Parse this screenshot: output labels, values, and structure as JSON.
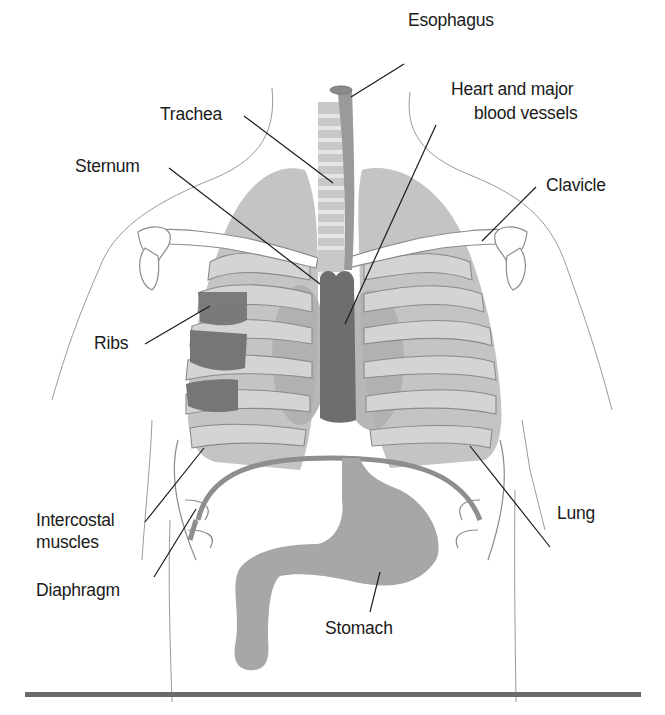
{
  "figure": {
    "colors": {
      "background": "#ffffff",
      "lung": "#c4c4c4",
      "rib_fill": "#d2d2d2",
      "outline": "#8a8a8a",
      "heart_shadow": "#a9a9a9",
      "heart": "#6e6e6e",
      "esophagus": "#9a9a9a",
      "trachea_ring": "#d0d0d0",
      "stomach": "#a8a8a8",
      "intercostal": "#767676",
      "diaphragm": "#8e8e8e",
      "leader_line": "#1a1a1a",
      "rule": "#6a6a6a"
    }
  },
  "labels": {
    "esophagus": "Esophagus",
    "trachea": "Trachea",
    "heart_line1": "Heart and major",
    "heart_line2": "blood vessels",
    "sternum": "Sternum",
    "clavicle": "Clavicle",
    "ribs": "Ribs",
    "intercostal_line1": "Intercostal",
    "intercostal_line2": "muscles",
    "lung": "Lung",
    "diaphragm": "Diaphragm",
    "stomach": "Stomach"
  },
  "leaders": [
    {
      "name": "esophagus",
      "x1": 404,
      "y1": 64,
      "x2": 351,
      "y2": 97
    },
    {
      "name": "trachea",
      "x1": 244,
      "y1": 116,
      "x2": 333,
      "y2": 183
    },
    {
      "name": "sternum",
      "x1": 169,
      "y1": 168,
      "x2": 320,
      "y2": 284
    },
    {
      "name": "heart",
      "x1": 436,
      "y1": 125,
      "x2": 345,
      "y2": 324
    },
    {
      "name": "clavicle",
      "x1": 536,
      "y1": 187,
      "x2": 482,
      "y2": 241
    },
    {
      "name": "ribs",
      "x1": 145,
      "y1": 344,
      "x2": 210,
      "y2": 306
    },
    {
      "name": "intercostal",
      "x1": 145,
      "y1": 522,
      "x2": 204,
      "y2": 448
    },
    {
      "name": "lung",
      "x1": 550,
      "y1": 547,
      "x2": 470,
      "y2": 446
    },
    {
      "name": "diaphragm",
      "x1": 154,
      "y1": 577,
      "x2": 196,
      "y2": 509
    },
    {
      "name": "stomach",
      "x1": 370,
      "y1": 612,
      "x2": 380,
      "y2": 572
    }
  ]
}
